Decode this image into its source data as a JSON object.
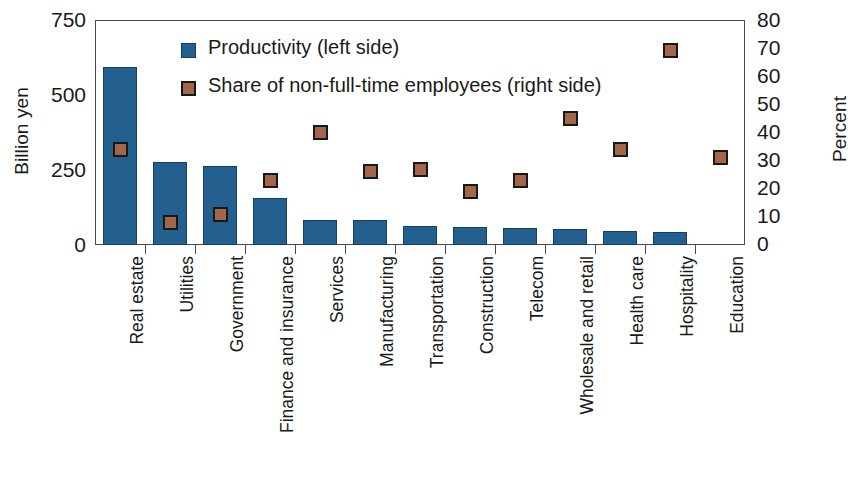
{
  "chart_data": {
    "type": "bar",
    "title": "",
    "subtitle": "",
    "xlabel": "",
    "ylabel": "Billion yen",
    "ylabel_right": "Percent",
    "ylim": [
      0,
      750
    ],
    "ylim_right": [
      0,
      80
    ],
    "yticks": [
      0,
      250,
      500,
      750
    ],
    "yticks_right": [
      0,
      10,
      20,
      30,
      40,
      50,
      60,
      70,
      80
    ],
    "grid": false,
    "legend_position": "top-left-inside",
    "categories": [
      "Real estate",
      "Utilities",
      "Government",
      "Finance and insurance",
      "Services",
      "Manufacturing",
      "Transportation",
      "Construction",
      "Telecom",
      "Wholesale and retail",
      "Health care",
      "Hospitality",
      "Education"
    ],
    "series": [
      {
        "name": "Productivity (left side)",
        "type": "bar",
        "axis": "left",
        "unit": "Billion yen",
        "color": "#24608f",
        "values": [
          595,
          278,
          262,
          157,
          85,
          82,
          65,
          60,
          58,
          55,
          48,
          42,
          0
        ]
      },
      {
        "name": "Share of non-full-time employees (right side)",
        "type": "scatter",
        "axis": "right",
        "unit": "Percent",
        "color": "#a3664b",
        "values": [
          34,
          8,
          11,
          23,
          40,
          26,
          27,
          19,
          23,
          45,
          34,
          69,
          31
        ]
      }
    ]
  },
  "legend": {
    "items": [
      {
        "label": "Productivity (left side)",
        "color": "#24608f",
        "shape": "square"
      },
      {
        "label": "Share of non-full-time employees (right side)",
        "color": "#a3664b",
        "shape": "square"
      }
    ]
  },
  "axes": {
    "left_title": "Billion yen",
    "right_title": "Percent",
    "left_ticklabels": [
      "750",
      "500",
      "250",
      "0"
    ],
    "right_ticklabels": [
      "80",
      "70",
      "60",
      "50",
      "40",
      "30",
      "20",
      "10",
      "0"
    ]
  },
  "colors": {
    "bar": "#24608f",
    "bar_border": "#17405f",
    "marker_fill": "#a3664b",
    "marker_border": "#17181a",
    "axis": "#4a4a4a",
    "text": "#1a1a1a",
    "background": "#ffffff"
  }
}
